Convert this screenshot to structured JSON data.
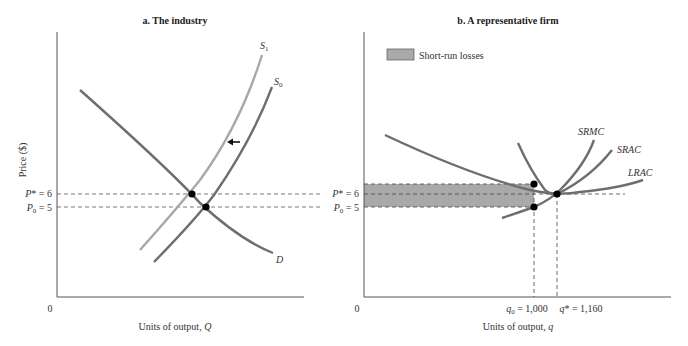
{
  "left_panel": {
    "title": "a. The industry",
    "y_axis_label": "Price ($)",
    "x_axis_label": "Units of output, ",
    "x_axis_var": "Q",
    "origin": "0",
    "price_labels": {
      "p_star": "P* = 6",
      "p_zero": "P",
      "p_zero_sub": "0",
      "p_zero_val": " = 5"
    },
    "curves": {
      "demand": "D",
      "supply_new": "S",
      "supply_new_sub": "1",
      "supply_old": "S",
      "supply_old_sub": "0"
    },
    "colors": {
      "supply_new": "#a8a8a8",
      "supply_old": "#6e6e6e",
      "demand": "#6e6e6e"
    }
  },
  "right_panel": {
    "title": "b. A representative firm",
    "x_axis_label": "Units of output, ",
    "x_axis_var": "q",
    "origin": "0",
    "legend": {
      "label": "Short-run losses",
      "color": "#a9a9a9"
    },
    "price_labels": {
      "p_star": "P* = 6",
      "p_zero": "P",
      "p_zero_sub": "0",
      "p_zero_val": " = 5"
    },
    "quantity_labels": {
      "q_zero": "q",
      "q_zero_sub": "0",
      "q_zero_val": " = 1,000",
      "q_star": "q* = 1,160"
    },
    "curves": {
      "srmc": "SRMC",
      "srac": "SRAC",
      "lrac": "LRAC"
    }
  }
}
